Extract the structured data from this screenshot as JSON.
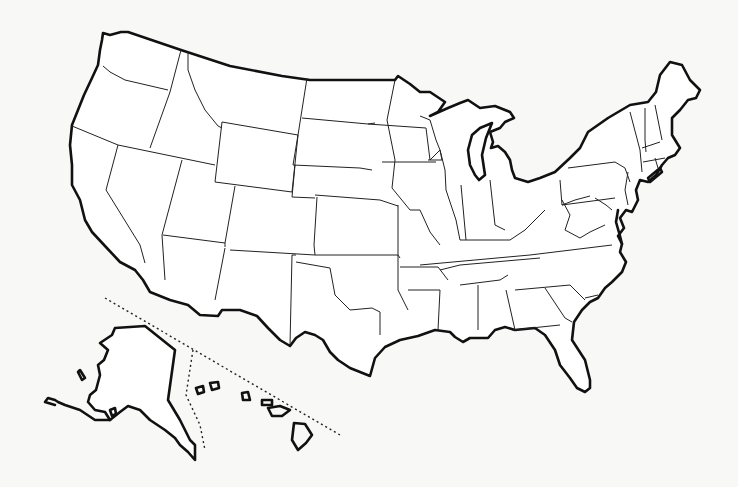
{
  "map": {
    "title": "Outline map of the United States",
    "type": "blank political outline map",
    "labels": [],
    "insets": [
      "Alaska",
      "Hawaii"
    ],
    "colors": {
      "background": "#f8f8f6",
      "land": "#ffffff",
      "lines": "#111111"
    }
  }
}
